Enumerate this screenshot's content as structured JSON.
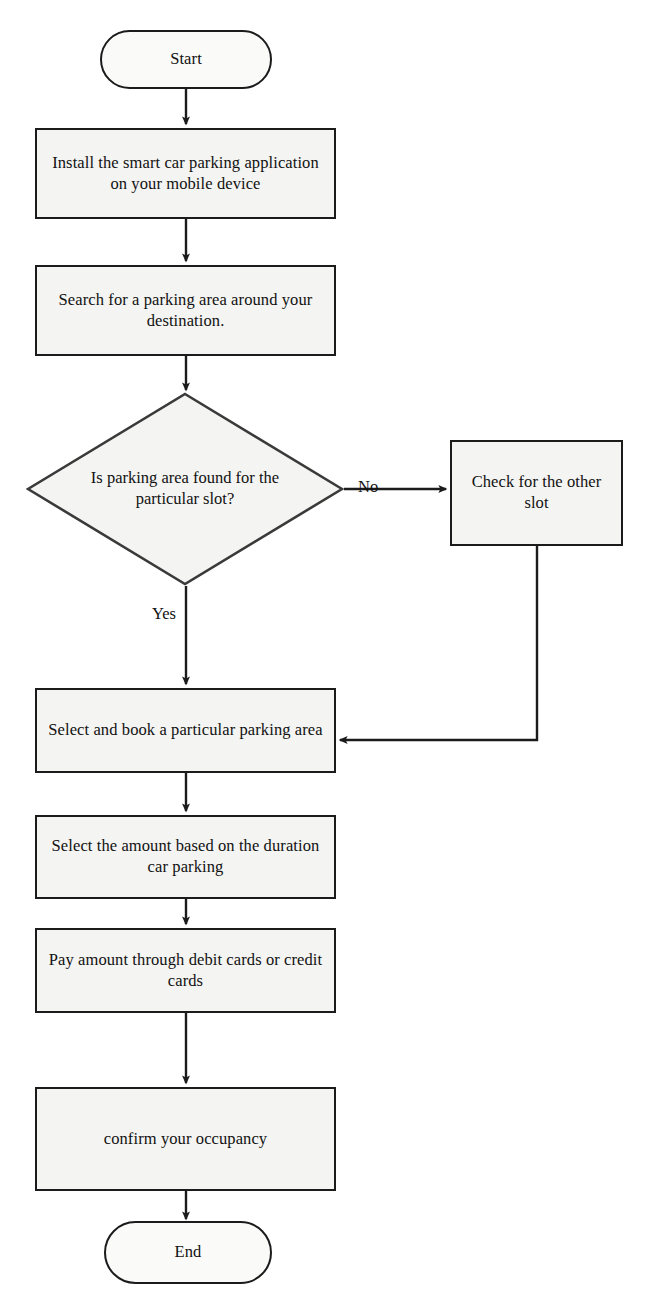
{
  "diagram": {
    "style": {
      "stroke": "#1b1b1b",
      "node_fill": "#f4f4f2",
      "terminator_fill": "#fafaf8",
      "text_color": "#111111",
      "background": "#ffffff"
    }
  },
  "nodes": {
    "start": {
      "label": "Start",
      "shape": "terminator"
    },
    "install": {
      "label": "Install the smart car parking application on your mobile device",
      "shape": "process"
    },
    "search": {
      "label": "Search for a parking area around your destination.",
      "shape": "process"
    },
    "decision": {
      "label": "Is parking area found for the particular slot?",
      "shape": "decision"
    },
    "check_other": {
      "label": "Check for the other slot",
      "shape": "process"
    },
    "select_book": {
      "label": "Select and book a particular parking area",
      "shape": "process"
    },
    "select_amount": {
      "label": "Select the amount based on the duration car parking",
      "shape": "process"
    },
    "pay_amount": {
      "label": "Pay amount through debit cards or credit cards",
      "shape": "process"
    },
    "confirm": {
      "label": "confirm your occupancy",
      "shape": "process"
    },
    "end": {
      "label": "End",
      "shape": "terminator"
    }
  },
  "edge_labels": {
    "no": "No",
    "yes": "Yes"
  },
  "edges": [
    {
      "from": "start",
      "to": "install",
      "label": ""
    },
    {
      "from": "install",
      "to": "search",
      "label": ""
    },
    {
      "from": "search",
      "to": "decision",
      "label": ""
    },
    {
      "from": "decision",
      "to": "check_other",
      "label": "No"
    },
    {
      "from": "decision",
      "to": "select_book",
      "label": "Yes"
    },
    {
      "from": "check_other",
      "to": "select_book",
      "label": ""
    },
    {
      "from": "select_book",
      "to": "select_amount",
      "label": ""
    },
    {
      "from": "select_amount",
      "to": "pay_amount",
      "label": ""
    },
    {
      "from": "pay_amount",
      "to": "confirm",
      "label": ""
    },
    {
      "from": "confirm",
      "to": "end",
      "label": ""
    }
  ]
}
